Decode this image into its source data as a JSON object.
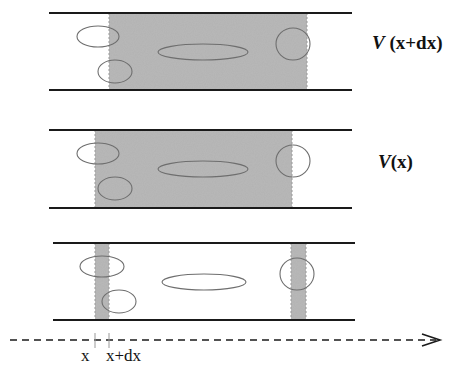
{
  "colors": {
    "background": "#ffffff",
    "shade": "#b8b8b8",
    "pipe_line": "#1a1a1a",
    "ellipse": "#6e6e6e",
    "axis": "#1a1a1a",
    "tick": "#999999"
  },
  "panels": [
    {
      "id": "top",
      "label_symbol": "V",
      "label_arg": " (x+dx)",
      "label_pos": {
        "x": 372,
        "y": 32
      },
      "pipe": {
        "x1": 49,
        "x2": 352,
        "y_top": 13,
        "y_bottom": 90
      },
      "shaded": [
        {
          "x1": 109,
          "x2": 307
        }
      ],
      "ellipses": [
        {
          "cx": 98,
          "cy": 36.5,
          "rx": 21,
          "ry": 10.5
        },
        {
          "cx": 115,
          "cy": 71.5,
          "rx": 17,
          "ry": 11.5
        },
        {
          "cx": 203,
          "cy": 52,
          "rx": 45,
          "ry": 8
        },
        {
          "cx": 293,
          "cy": 44,
          "rx": 17,
          "ry": 16
        }
      ]
    },
    {
      "id": "middle",
      "label_symbol": "V",
      "label_arg": "(x)",
      "label_pos": {
        "x": 378,
        "y": 151
      },
      "pipe": {
        "x1": 49,
        "x2": 352,
        "y_top": 130,
        "y_bottom": 208
      },
      "shaded": [
        {
          "x1": 95,
          "x2": 292
        }
      ],
      "ellipses": [
        {
          "cx": 98,
          "cy": 153.5,
          "rx": 21,
          "ry": 10.5
        },
        {
          "cx": 115,
          "cy": 188.5,
          "rx": 17,
          "ry": 11.5
        },
        {
          "cx": 203,
          "cy": 169,
          "rx": 45,
          "ry": 8
        },
        {
          "cx": 293,
          "cy": 161,
          "rx": 17,
          "ry": 16
        }
      ]
    },
    {
      "id": "bottom",
      "label_symbol": "",
      "label_arg": "",
      "pipe": {
        "x1": 53,
        "x2": 355,
        "y_top": 243,
        "y_bottom": 320
      },
      "shaded": [
        {
          "x1": 95,
          "x2": 109
        },
        {
          "x1": 291,
          "x2": 306
        }
      ],
      "ellipses": [
        {
          "cx": 102,
          "cy": 266.5,
          "rx": 22,
          "ry": 10.5
        },
        {
          "cx": 119,
          "cy": 301.5,
          "rx": 17,
          "ry": 11.5
        },
        {
          "cx": 204,
          "cy": 282,
          "rx": 42,
          "ry": 8
        },
        {
          "cx": 297,
          "cy": 274,
          "rx": 17,
          "ry": 16
        }
      ]
    }
  ],
  "axis": {
    "y": 340,
    "x_start": 10,
    "x_end": 440,
    "ticks": [
      {
        "x": 95,
        "label": "x"
      },
      {
        "x": 109,
        "label": "x+dx"
      }
    ],
    "tick_labels": {
      "x": "x",
      "xdx": "x+dx"
    }
  },
  "labels": {
    "top_symbol": "V",
    "top_arg": " (x+dx)",
    "middle_symbol": "V",
    "middle_arg": "(x)"
  }
}
